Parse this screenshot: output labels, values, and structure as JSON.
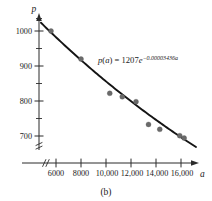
{
  "figure": {
    "caption": "(b)",
    "equation": {
      "func_name": "p",
      "func_arg": "a",
      "lhs": "p(a)",
      "equals": "=",
      "coefficient": "1207",
      "base": "e",
      "exponent": "−0.00003436a",
      "full_text": "p(a) = 1207e^(-0.00003436a)"
    }
  },
  "chart_data": {
    "type": "scatter",
    "title": "",
    "subtitle": "",
    "xlabel": "a",
    "ylabel": "p",
    "xlim": [
      4600,
      17400
    ],
    "ylim": [
      640,
      1060
    ],
    "grid": false,
    "legend": null,
    "axis_breaks": {
      "x_break_between": [
        0,
        5600
      ],
      "y_break_below": 660
    },
    "xticks": [
      6000,
      8000,
      10000,
      12000,
      14000,
      16000
    ],
    "xtick_labels": [
      "6000",
      "8000",
      "10,000",
      "12,000",
      "14,000",
      "16,000"
    ],
    "yticks": [
      700,
      800,
      900,
      1000
    ],
    "ytick_labels": [
      "700",
      "800",
      "900",
      "1000"
    ],
    "yticks_minor": [
      650,
      750,
      850,
      950,
      1050
    ],
    "points": [
      {
        "x": 5600,
        "y": 1000
      },
      {
        "x": 8000,
        "y": 920
      },
      {
        "x": 10300,
        "y": 822
      },
      {
        "x": 11300,
        "y": 812
      },
      {
        "x": 12400,
        "y": 798
      },
      {
        "x": 13400,
        "y": 733
      },
      {
        "x": 14300,
        "y": 719
      },
      {
        "x": 15900,
        "y": 701
      },
      {
        "x": 16250,
        "y": 694
      }
    ],
    "series": [
      {
        "name": "fitted exponential model",
        "type": "line",
        "equation": "p(a) = 1207e^(-0.00003436a)",
        "params": {
          "amplitude": 1207,
          "rate": -3.436e-05
        },
        "x_range": [
          4800,
          17200
        ]
      }
    ],
    "annotations": [
      {
        "text": "p(a) = 1207e^(-0.00003436a)",
        "x": 11700,
        "y": 905
      }
    ]
  },
  "colors": {
    "axis": "#2b2b2b",
    "curve": "#141414",
    "point_fill": "#6a6a6a",
    "text": "#1a1a1a",
    "background": "#ffffff"
  }
}
